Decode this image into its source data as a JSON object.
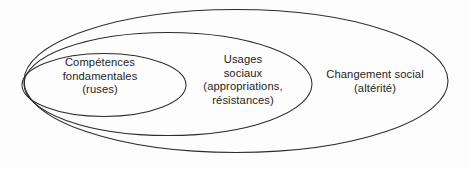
{
  "diagram": {
    "type": "nested-ellipses-euler-diagram",
    "background_color": "#fdfdfd",
    "stroke_color": "#2b2b2b",
    "text_color": "#242424",
    "regions": [
      {
        "id": "competences",
        "name": "Compétences fondamentales (ruses)",
        "level": "inner",
        "lines": [
          "Compétences",
          "fondamentales",
          "(ruses)"
        ]
      },
      {
        "id": "usages",
        "name": "Usages sociaux (appropriations, résistances)",
        "level": "middle",
        "lines": [
          "Usages",
          "sociaux",
          "(appropriations,",
          "résistances)"
        ]
      },
      {
        "id": "changement",
        "name": "Changement social (altérité)",
        "level": "outer",
        "lines": [
          "Changement social",
          "(altérité)"
        ]
      }
    ]
  }
}
